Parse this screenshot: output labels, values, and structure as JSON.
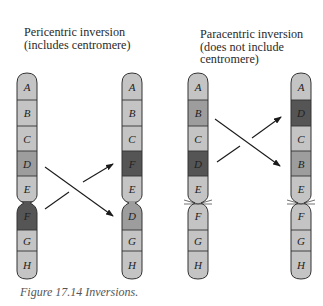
{
  "headings": {
    "pericentric": "Pericentric inversion\n(includes centromere)",
    "paracentric": "Paracentric inversion\n(does not include\ncentromere)"
  },
  "caption": "Figure 17.14  Inversions.",
  "colors": {
    "light": "#c4c4c4",
    "medium": "#9d9d9d",
    "dark": "#555555",
    "outline": "#333333"
  },
  "chromosomes": [
    {
      "id": "pericentric-original",
      "segments": [
        {
          "label": "A",
          "shade": "light"
        },
        {
          "label": "B",
          "shade": "light"
        },
        {
          "label": "C",
          "shade": "light"
        },
        {
          "label": "D",
          "shade": "medium"
        },
        {
          "label": "E",
          "shade": "light"
        },
        {
          "label": "F",
          "shade": "dark"
        },
        {
          "label": "G",
          "shade": "light"
        },
        {
          "label": "H",
          "shade": "light"
        }
      ],
      "centromere_after": "E"
    },
    {
      "id": "pericentric-inverted",
      "segments": [
        {
          "label": "A",
          "shade": "light"
        },
        {
          "label": "B",
          "shade": "light"
        },
        {
          "label": "C",
          "shade": "light"
        },
        {
          "label": "F",
          "shade": "dark"
        },
        {
          "label": "E",
          "shade": "light"
        },
        {
          "label": "D",
          "shade": "medium"
        },
        {
          "label": "G",
          "shade": "light"
        },
        {
          "label": "H",
          "shade": "light"
        }
      ],
      "centromere_after": "E"
    },
    {
      "id": "paracentric-original",
      "segments": [
        {
          "label": "A",
          "shade": "light"
        },
        {
          "label": "B",
          "shade": "medium"
        },
        {
          "label": "C",
          "shade": "light"
        },
        {
          "label": "D",
          "shade": "dark"
        },
        {
          "label": "E",
          "shade": "light"
        },
        {
          "label": "F",
          "shade": "light"
        },
        {
          "label": "G",
          "shade": "light"
        },
        {
          "label": "H",
          "shade": "light"
        }
      ],
      "centromere_after": "E"
    },
    {
      "id": "paracentric-inverted",
      "segments": [
        {
          "label": "A",
          "shade": "light"
        },
        {
          "label": "D",
          "shade": "dark"
        },
        {
          "label": "C",
          "shade": "light"
        },
        {
          "label": "B",
          "shade": "medium"
        },
        {
          "label": "E",
          "shade": "light"
        },
        {
          "label": "F",
          "shade": "light"
        },
        {
          "label": "G",
          "shade": "light"
        },
        {
          "label": "H",
          "shade": "light"
        }
      ],
      "centromere_after": "E"
    }
  ],
  "arrows": [
    {
      "id": "pericentric-D-to-D",
      "from": "D",
      "to": "D"
    },
    {
      "id": "pericentric-F-to-F",
      "from": "F",
      "to": "F"
    },
    {
      "id": "paracentric-B-to-B",
      "from": "B",
      "to": "B"
    },
    {
      "id": "paracentric-D-to-D",
      "from": "D",
      "to": "D"
    }
  ]
}
